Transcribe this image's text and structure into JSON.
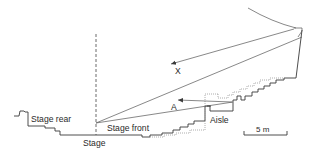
{
  "figure": {
    "type": "theatre-section-diagram",
    "labels": {
      "stage_rear": "Stage rear",
      "stage_front": "Stage front",
      "stage": "Stage",
      "aisle": "Aisle",
      "sightline_x": "X",
      "sightline_a": "A",
      "scale": "5 m"
    },
    "colors": {
      "line": "#3a3a3a",
      "dotted_line": "#9a9a9a",
      "text": "#2a2a2a",
      "background": "#ffffff"
    },
    "elements": [
      "stage-rear-profile",
      "stage-floor",
      "stage-centre-dashed-line",
      "stalls-stepped-seating",
      "aisle-section",
      "upper-stepped-seating",
      "alternative-dotted-rake",
      "reflector-ceiling-curve",
      "sightline-x-arrow",
      "sightline-a-arrow",
      "scale-bar"
    ]
  }
}
